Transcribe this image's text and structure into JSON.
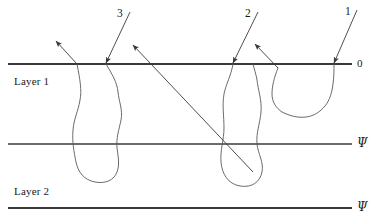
{
  "figure": {
    "background_color": "#ffffff",
    "line_color": "#3a3a3a",
    "curve_color": "#5a5a5a",
    "text_color": "#1a1a1a",
    "width": 379,
    "height": 223
  },
  "layers": [
    {
      "id": "layer-1",
      "label": "Layer 1"
    },
    {
      "id": "layer-2",
      "label": "Layer 2"
    }
  ],
  "interfaces": [
    {
      "id": "interface-0",
      "label": "0",
      "y": 64
    },
    {
      "id": "interface-psi-1",
      "label": "Ψ",
      "y": 144
    },
    {
      "id": "interface-psi-2",
      "label": "Ψ",
      "y": 208
    }
  ],
  "rays": [
    {
      "id": "ray-3",
      "label": "3"
    },
    {
      "id": "ray-2",
      "label": "2"
    },
    {
      "id": "ray-1",
      "label": "1"
    }
  ],
  "geometry": {
    "interface_lines": [
      {
        "name": "top-interface-line",
        "x1": 8,
        "y1": 64,
        "x2": 352,
        "y2": 64,
        "width": 2.0
      },
      {
        "name": "middle-interface-line",
        "x1": 8,
        "y1": 144,
        "x2": 352,
        "y2": 144,
        "width": 1.3
      },
      {
        "name": "bottom-interface-line",
        "x1": 8,
        "y1": 208,
        "x2": 352,
        "y2": 208,
        "width": 2.0
      }
    ],
    "incident_rays": [
      {
        "name": "incident-ray-3",
        "x1": 130,
        "y1": 12,
        "x2": 106,
        "y2": 63
      },
      {
        "name": "incident-ray-2",
        "x1": 258,
        "y1": 12,
        "x2": 233,
        "y2": 63
      },
      {
        "name": "incident-ray-1",
        "x1": 357,
        "y1": 10,
        "x2": 334,
        "y2": 63
      }
    ],
    "outgoing_rays": [
      {
        "name": "outgoing-ray-left",
        "x1": 77,
        "y1": 64,
        "x2": 56,
        "y2": 41
      },
      {
        "name": "outgoing-ray-long-diagonal",
        "x1": 253,
        "y1": 172,
        "x2": 133,
        "y2": 45
      },
      {
        "name": "outgoing-ray-right",
        "x1": 278,
        "y1": 68,
        "x2": 255,
        "y2": 44
      }
    ],
    "scatter_paths": [
      {
        "name": "scatter-path-left",
        "d": "M 77 64 C 80 80 82 90 80 100 C 78 112 74 118 73 130 C 72 142 74 152 76 162 C 78 172 84 180 95 182 C 106 184 114 180 117 172 C 120 164 118 156 117 148 C 116 138 119 130 121 120 C 123 110 119 102 118 92 C 117 82 112 74 106 64"
      },
      {
        "name": "scatter-path-middle",
        "d": "M 233 64 C 231 76 226 84 224 94 C 222 106 224 116 224 128 C 224 140 220 150 221 162 C 222 174 228 184 240 186 C 252 188 260 182 262 172 C 264 162 258 154 257 144 C 256 132 260 124 261 112 C 262 100 258 90 257 80 C 256 74 254 68 253 64"
      },
      {
        "name": "scatter-path-right",
        "d": "M 278 68 C 274 78 272 86 272 94 C 272 102 276 108 282 112 C 290 116 298 118 306 117 C 314 116 320 112 325 106 C 330 100 332 92 333 84 C 334 76 334 70 334 64"
      }
    ],
    "arrowheads": [
      {
        "name": "arrowhead-outgoing-left",
        "x": 56,
        "y": 41,
        "angle": -132
      },
      {
        "name": "arrowhead-incident-3",
        "x": 106,
        "y": 63,
        "angle": 115
      },
      {
        "name": "arrowhead-outgoing-long-diagonal",
        "x": 133,
        "y": 45,
        "angle": -133
      },
      {
        "name": "arrowhead-incident-2",
        "x": 233,
        "y": 63,
        "angle": 114
      },
      {
        "name": "arrowhead-outgoing-right",
        "x": 255,
        "y": 44,
        "angle": -134
      },
      {
        "name": "arrowhead-incident-1",
        "x": 334,
        "y": 63,
        "angle": 114
      }
    ]
  },
  "label_positions": {
    "layer_1": {
      "x": 14,
      "y": 76
    },
    "layer_2": {
      "x": 14,
      "y": 186
    },
    "ray_3": {
      "x": 117,
      "y": 8
    },
    "ray_2": {
      "x": 245,
      "y": 8
    },
    "ray_1": {
      "x": 345,
      "y": 6
    },
    "interface_0": {
      "x": 357,
      "y": 58
    },
    "interface_psi_1": {
      "x": 357,
      "y": 137
    },
    "interface_psi_2": {
      "x": 357,
      "y": 201
    }
  }
}
